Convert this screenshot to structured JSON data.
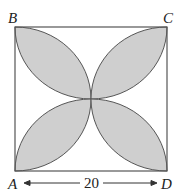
{
  "diagram": {
    "type": "square with four shaded petals",
    "vertices": {
      "A": "A",
      "B": "B",
      "C": "C",
      "D": "D"
    },
    "side_length_label": "20",
    "colors": {
      "shade": "#cfcfcf",
      "stroke": "#555555",
      "background": "#ffffff"
    }
  }
}
